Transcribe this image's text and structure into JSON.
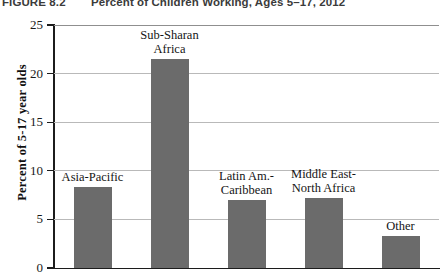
{
  "caption": {
    "number": "FIGURE 8.2",
    "title": "Percent of Children Working, Ages 5–17, 2012"
  },
  "colors": {
    "bar_fill": "#6b6b6b",
    "axis": "#1c1c1c",
    "gridline": "#b9b9b9",
    "background": "#ffffff"
  },
  "chart_data": {
    "type": "bar",
    "title": "Percent of Children Working, Ages 5–17, 2012",
    "xlabel": "",
    "ylabel": "Percent of 5-17 year olds",
    "ylim": [
      0,
      25
    ],
    "yticks": [
      0,
      5,
      10,
      15,
      20,
      25
    ],
    "ytick_labels": [
      "0",
      "5",
      "10",
      "15",
      "20",
      "25"
    ],
    "grid": true,
    "legend": false,
    "categories": [
      "Asia-Pacific",
      "Sub-Sharan\nAfrica",
      "Latin Am.-\nCaribbean",
      "Middle East-\nNorth Africa",
      "Other"
    ],
    "values": [
      8.3,
      21.5,
      7.0,
      7.2,
      3.3
    ]
  }
}
